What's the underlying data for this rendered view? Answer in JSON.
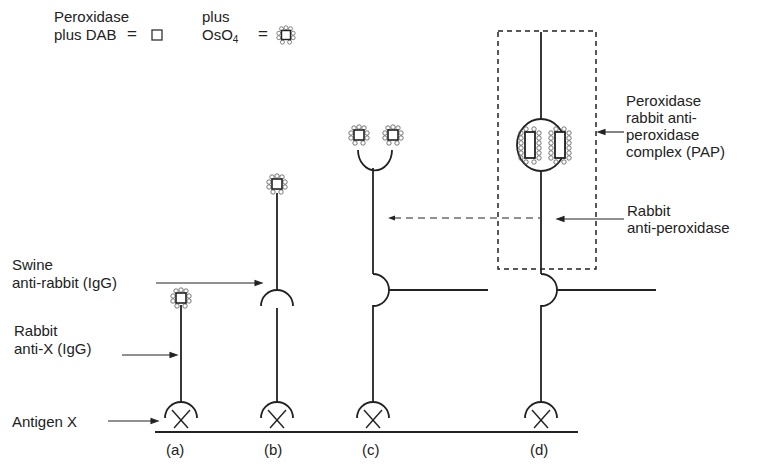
{
  "legend": {
    "dab": {
      "line1": "Peroxidase",
      "line2": "plus DAB",
      "equals": "=",
      "symbol": "open-square"
    },
    "oso4": {
      "line1": "plus",
      "line2_main": "OsO",
      "line2_sub": "4",
      "equals": "=",
      "symbol": "square-with-beads"
    }
  },
  "labels": {
    "swine_line1": "Swine",
    "swine_line2": "anti-rabbit (IgG)",
    "rabbit_x_line1": "Rabbit",
    "rabbit_x_line2": "anti-X (IgG)",
    "antigen": "Antigen X",
    "pap_line1": "Peroxidase",
    "pap_line2": "rabbit anti-",
    "pap_line3": "peroxidase",
    "pap_line4": "complex (PAP)",
    "rabbit_perox_line1": "Rabbit",
    "rabbit_perox_line2": "anti-peroxidase"
  },
  "panels": [
    {
      "id": "a",
      "label": "(a)"
    },
    {
      "id": "b",
      "label": "(b)"
    },
    {
      "id": "c",
      "label": "(c)"
    },
    {
      "id": "d",
      "label": "(d)"
    }
  ],
  "colors": {
    "ink": "#222222",
    "background": "#ffffff"
  }
}
